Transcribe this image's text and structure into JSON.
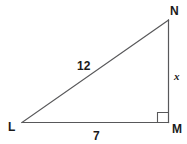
{
  "diagram": {
    "type": "right-triangle",
    "vertices": {
      "top_right": "N",
      "bottom_left": "L",
      "bottom_right": "M"
    },
    "sides": {
      "hypotenuse_LN": "12",
      "base_LM": "7",
      "vertical_MN": "x"
    },
    "right_angle_at": "M",
    "colors": {
      "line": "#58585a",
      "text": "#1a1a1a",
      "background": "#ffffff"
    }
  }
}
